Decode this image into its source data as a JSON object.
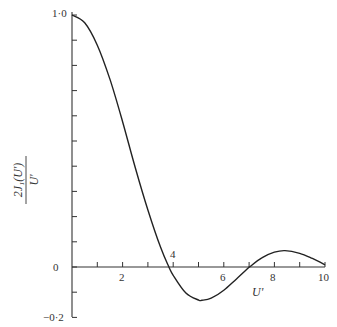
{
  "chart_data": {
    "type": "line",
    "title": "",
    "xlabel": "U'",
    "ylabel_numerator": "2J₁(U')",
    "ylabel_denominator": "U'",
    "xlim": [
      0,
      10
    ],
    "ylim": [
      -0.2,
      1.0
    ],
    "grid": false,
    "x_tick_labels": [
      "2",
      "4",
      "6",
      "8",
      "10"
    ],
    "x_ticks": [
      1,
      2,
      3,
      4,
      5,
      6,
      7,
      8,
      9,
      10
    ],
    "y_tick_labels": [
      "1·0",
      "0",
      "−0·2"
    ],
    "y_ticks": [
      1.0,
      0.9,
      0.8,
      0.7,
      0.6,
      0.5,
      0.4,
      0.3,
      0.2,
      0.1,
      0.0,
      -0.1,
      -0.2
    ],
    "series": [
      {
        "name": "2J1(U')/U'",
        "x": [
          0,
          0.5,
          1,
          1.5,
          2,
          2.5,
          3,
          3.5,
          3.832,
          4,
          4.5,
          5,
          5.136,
          5.5,
          6,
          6.5,
          7,
          7.016,
          7.5,
          8,
          8.417,
          9,
          9.5,
          10
        ],
        "y": [
          1.0,
          0.9691,
          0.8801,
          0.7445,
          0.5767,
          0.3942,
          0.226,
          0.0781,
          0.0,
          -0.033,
          -0.1033,
          -0.131,
          -0.1323,
          -0.1239,
          -0.0922,
          -0.0472,
          -0.0013,
          0.0,
          0.0362,
          0.0588,
          0.065,
          0.0545,
          0.0341,
          0.0087
        ]
      }
    ]
  },
  "labels": {
    "y_top": "1·0",
    "y_zero": "0",
    "y_bottom": "−0·2",
    "x_2": "2",
    "x_4": "4",
    "x_6": "6",
    "x_8": "8",
    "x_10": "10",
    "x_axis": "U'",
    "y_num": "2J₁(U')",
    "y_den": "U'"
  }
}
